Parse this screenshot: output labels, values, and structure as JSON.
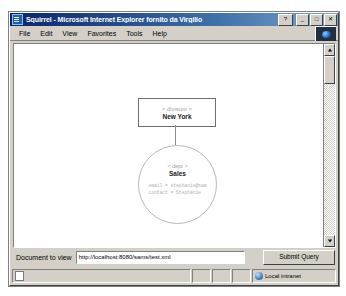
{
  "window": {
    "title": "Squirrel - Microsoft Internet Explorer fornito da Virgilio",
    "icon": "ie-document-icon",
    "controls": {
      "help_label": "?",
      "minimize_label": "_",
      "maximize_label": "□",
      "close_label": "✕"
    }
  },
  "menu": {
    "items": [
      {
        "label": "File",
        "accel": "F"
      },
      {
        "label": "Edit",
        "accel": "E"
      },
      {
        "label": "View",
        "accel": "V"
      },
      {
        "label": "Favorites",
        "accel": "a"
      },
      {
        "label": "Tools",
        "accel": "T"
      },
      {
        "label": "Help",
        "accel": "H"
      }
    ],
    "logo": "internet-explorer-logo"
  },
  "diagram": {
    "root_node": {
      "tag": "< division >",
      "name": "New York"
    },
    "child_node": {
      "tag": "< dept >",
      "name": "Sales",
      "attributes": [
        "email = stephanie@sam",
        "contact = Stephanie"
      ]
    }
  },
  "form": {
    "label": "Document to view",
    "url_value": "http://localhost:8080/sams/test.xml",
    "url_placeholder": "http://",
    "submit_label": "Submit Query"
  },
  "status": {
    "message": "",
    "zone": "Local intranet"
  },
  "scrollbar": {
    "up_arrow": "scroll-up-arrow",
    "down_arrow": "scroll-down-arrow"
  },
  "colors": {
    "titlebar_start": "#0a246a",
    "titlebar_end": "#7ba2cc",
    "chrome": "#d4d0c8",
    "page_bg": "#ffffff",
    "node_border": "#6e6e6e",
    "circle_border": "#b8b8b8",
    "tag_text": "#9a9a9a",
    "attr_text": "#b0b0b0"
  }
}
